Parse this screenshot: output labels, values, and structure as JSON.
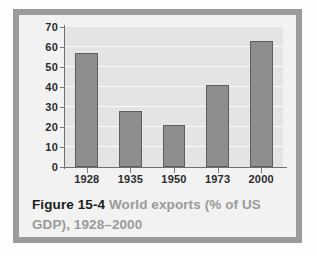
{
  "figure": {
    "caption_label": "Figure 15-4",
    "caption_text": "World exports (% of US GDP), 1928–2000"
  },
  "colors": {
    "bar_fill": "#8d8d8d",
    "bar_outline": "#5d5d5d",
    "plot_background": "#e4e4e4",
    "gridline": "#fafafa",
    "frame": "#9b9b9b",
    "panel": "#f2f2f2",
    "axis": "#6f6f6f",
    "caption_label": "#1c1c1c",
    "caption_text": "#9a9a9a"
  },
  "chart_data": {
    "type": "bar",
    "title": "World exports (% of US GDP), 1928–2000",
    "xlabel": "",
    "ylabel": "",
    "categories": [
      "1928",
      "1935",
      "1950",
      "1973",
      "2000"
    ],
    "values": [
      57,
      28,
      21,
      41,
      63
    ],
    "ylim": [
      0,
      70
    ],
    "yticks": [
      0,
      10,
      20,
      30,
      40,
      50,
      60,
      70
    ],
    "ytick_labels": [
      "0",
      "10",
      "20",
      "30",
      "40",
      "50",
      "60",
      "70"
    ],
    "grid": true,
    "grid_axis": "y",
    "legend": false,
    "legend_position": "none"
  }
}
